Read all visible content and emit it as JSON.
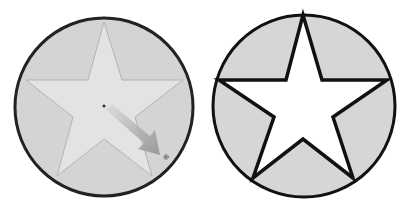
{
  "figure": {
    "panels": [
      {
        "name": "left",
        "state": "dragging",
        "circle_fill": "#d4d4d4",
        "circle_stroke": "#222222",
        "star_fill": "#e2e2e2",
        "star_stroke": "#b5b5b5",
        "arrow_color": "#9a9a9a"
      },
      {
        "name": "right",
        "state": "result",
        "circle_fill": "#d6d6d6",
        "circle_stroke": "#111111",
        "star_fill": "#ffffff",
        "star_stroke": "#111111"
      }
    ]
  }
}
